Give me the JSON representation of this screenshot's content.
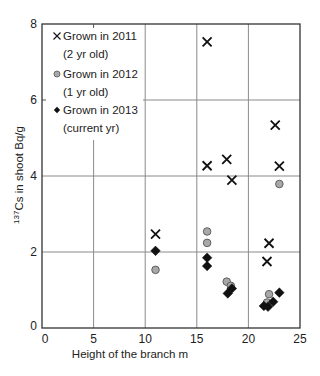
{
  "chart_data": {
    "type": "scatter",
    "title": "",
    "xlabel": "Height of the branch  m",
    "ylabel_sup": "137",
    "ylabel": "Cs in shoot  Bq/g",
    "xlim": [
      0,
      25
    ],
    "ylim": [
      0,
      8
    ],
    "xticks": [
      0,
      5,
      10,
      15,
      20,
      25
    ],
    "yticks": [
      0,
      2,
      4,
      6,
      8
    ],
    "grid": true,
    "legend_position": "upper left",
    "series": [
      {
        "name": "Grown in 2011 (2 yr old)",
        "legend_line1": "Grown in 2011",
        "legend_line2": "(2 yr old)",
        "marker": "x",
        "color": "#111111",
        "points": [
          [
            11.0,
            2.47
          ],
          [
            16.0,
            7.53
          ],
          [
            16.0,
            4.27
          ],
          [
            17.9,
            4.44
          ],
          [
            18.4,
            3.89
          ],
          [
            22.6,
            5.34
          ],
          [
            23.0,
            4.26
          ],
          [
            22.0,
            2.23
          ],
          [
            21.8,
            1.75
          ]
        ]
      },
      {
        "name": "Grown in 2012 (1 yr old)",
        "legend_line1": "Grown in 2012",
        "legend_line2": "(1 yr old)",
        "marker": "circle",
        "color": "#a8a8a8",
        "points": [
          [
            11.0,
            1.53
          ],
          [
            16.0,
            2.54
          ],
          [
            16.0,
            2.24
          ],
          [
            17.9,
            1.22
          ],
          [
            18.3,
            1.11
          ],
          [
            23.0,
            3.79
          ],
          [
            22.0,
            0.89
          ],
          [
            21.8,
            0.67
          ]
        ]
      },
      {
        "name": "Grown in 2013 (current yr)",
        "legend_line1": "Grown in 2013",
        "legend_line2": "(current yr)",
        "marker": "diamond",
        "color": "#111111",
        "points": [
          [
            11.0,
            2.03
          ],
          [
            16.0,
            1.85
          ],
          [
            16.0,
            1.63
          ],
          [
            18.4,
            1.04
          ],
          [
            18.0,
            0.91
          ],
          [
            23.0,
            0.93
          ],
          [
            22.4,
            0.69
          ],
          [
            21.9,
            0.56
          ],
          [
            21.5,
            0.58
          ]
        ]
      }
    ]
  }
}
